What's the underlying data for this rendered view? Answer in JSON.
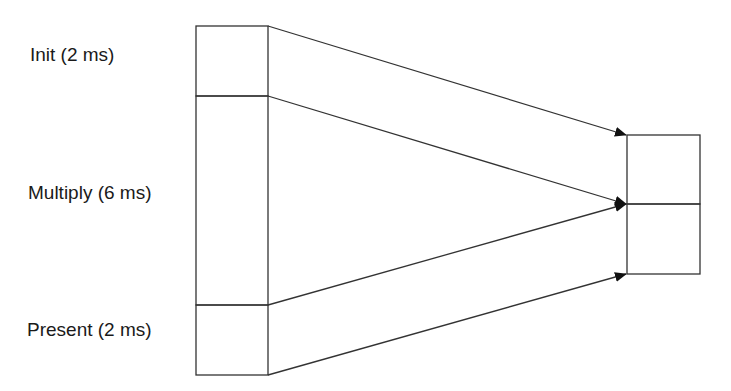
{
  "diagram": {
    "stages": [
      {
        "label": "Init (2 ms)",
        "name": "Init",
        "duration_ms": 2
      },
      {
        "label": "Multiply (6 ms)",
        "name": "Multiply",
        "duration_ms": 6
      },
      {
        "label": "Present (2 ms)",
        "name": "Present",
        "duration_ms": 2
      }
    ],
    "colors": {
      "stroke": "#333333",
      "arrow": "#111111",
      "background": "#ffffff"
    }
  }
}
